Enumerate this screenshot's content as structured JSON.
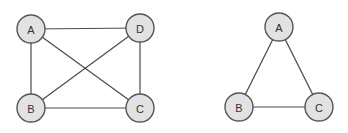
{
  "colors": {
    "node_fill": "#e2e2e2",
    "node_stroke": "#555555",
    "edge": "#4a4a4a",
    "label": "#333333",
    "background": "#ffffff"
  },
  "graphs": [
    {
      "name": "complete-graph-k4",
      "nodes": [
        {
          "id": "A",
          "label": "A",
          "x": 31,
          "y": 29
        },
        {
          "id": "D",
          "label": "D",
          "x": 140,
          "y": 28
        },
        {
          "id": "B",
          "label": "B",
          "x": 31,
          "y": 108
        },
        {
          "id": "C",
          "label": "C",
          "x": 140,
          "y": 108
        }
      ],
      "edges": [
        [
          "A",
          "D"
        ],
        [
          "A",
          "B"
        ],
        [
          "A",
          "C"
        ],
        [
          "D",
          "B"
        ],
        [
          "D",
          "C"
        ],
        [
          "B",
          "C"
        ]
      ]
    },
    {
      "name": "triangle-graph-k3",
      "nodes": [
        {
          "id": "A",
          "label": "A",
          "x": 279,
          "y": 27
        },
        {
          "id": "B",
          "label": "B",
          "x": 239,
          "y": 107
        },
        {
          "id": "C",
          "label": "C",
          "x": 319,
          "y": 107
        }
      ],
      "edges": [
        [
          "A",
          "B"
        ],
        [
          "A",
          "C"
        ],
        [
          "B",
          "C"
        ]
      ]
    }
  ],
  "node_radius": 14
}
